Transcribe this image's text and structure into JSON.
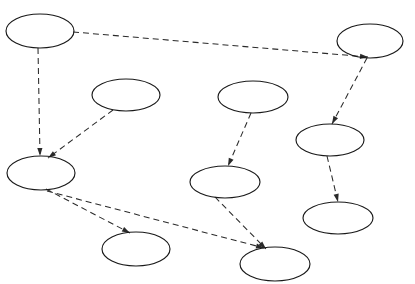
{
  "figure": {
    "title": "",
    "background_color": "#ffffff",
    "node_stroke_color": "#1a1a1a",
    "edge_stroke_color": "#2a2a2a",
    "edge_style": "dashed",
    "width": 415,
    "height": 284
  },
  "chart_data": {
    "type": "diagram",
    "title": "",
    "xlabel": "",
    "ylabel": "",
    "grid": false,
    "legend": "none",
    "node_shape": "ellipse",
    "edge_style": "dashed-with-arrowhead",
    "directed": true,
    "node_count": 10,
    "edge_count": 9,
    "nodes": [
      {
        "id": "n1",
        "label": "",
        "cx": 40,
        "cy": 31,
        "rx": 34,
        "ry": 17
      },
      {
        "id": "n2",
        "label": "",
        "cx": 126,
        "cy": 95,
        "rx": 34,
        "ry": 16
      },
      {
        "id": "n3",
        "label": "",
        "cx": 253,
        "cy": 97,
        "rx": 35,
        "ry": 16
      },
      {
        "id": "n4",
        "label": "",
        "cx": 370,
        "cy": 41,
        "rx": 33,
        "ry": 17
      },
      {
        "id": "n5",
        "label": "",
        "cx": 330,
        "cy": 140,
        "rx": 34,
        "ry": 16
      },
      {
        "id": "n6",
        "label": "",
        "cx": 338,
        "cy": 218,
        "rx": 35,
        "ry": 16
      },
      {
        "id": "n7",
        "label": "",
        "cx": 41,
        "cy": 173,
        "rx": 34,
        "ry": 17
      },
      {
        "id": "n8",
        "label": "",
        "cx": 225,
        "cy": 182,
        "rx": 35,
        "ry": 16
      },
      {
        "id": "n9",
        "label": "",
        "cx": 136,
        "cy": 249,
        "rx": 34,
        "ry": 17
      },
      {
        "id": "n10",
        "label": "",
        "cx": 275,
        "cy": 264,
        "rx": 35,
        "ry": 17
      }
    ],
    "edges": [
      {
        "from": "n1",
        "to": "n4",
        "x1": 73,
        "y1": 32,
        "x2": 368,
        "y2": 57,
        "arrow": true
      },
      {
        "from": "n1",
        "to": "n7",
        "x1": 38,
        "y1": 48,
        "x2": 40,
        "y2": 156,
        "arrow": true
      },
      {
        "from": "n2",
        "to": "n7",
        "x1": 113,
        "y1": 110,
        "x2": 48,
        "y2": 158,
        "arrow": true
      },
      {
        "from": "n3",
        "to": "n8",
        "x1": 251,
        "y1": 113,
        "x2": 228,
        "y2": 166,
        "arrow": true
      },
      {
        "from": "n4",
        "to": "n5",
        "x1": 367,
        "y1": 58,
        "x2": 332,
        "y2": 124,
        "arrow": true
      },
      {
        "from": "n5",
        "to": "n6",
        "x1": 327,
        "y1": 156,
        "x2": 338,
        "y2": 202,
        "arrow": true
      },
      {
        "from": "n7",
        "to": "n9",
        "x1": 46,
        "y1": 189,
        "x2": 130,
        "y2": 233,
        "arrow": true
      },
      {
        "from": "n7",
        "to": "n10",
        "x1": 47,
        "y1": 191,
        "x2": 264,
        "y2": 248,
        "arrow": true
      },
      {
        "from": "n8",
        "to": "n10",
        "x1": 215,
        "y1": 197,
        "x2": 266,
        "y2": 249,
        "arrow": true
      }
    ]
  }
}
